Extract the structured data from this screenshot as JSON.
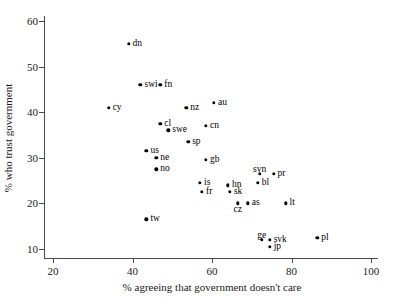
{
  "chart_data": {
    "type": "scatter",
    "title": "",
    "xlabel": "% agreeing that government doesn't care",
    "ylabel": "% who trust government",
    "xlim": [
      20,
      100
    ],
    "ylim": [
      10,
      60
    ],
    "xticks": [
      20,
      40,
      60,
      80,
      100
    ],
    "yticks": [
      10,
      20,
      30,
      40,
      50,
      60
    ],
    "grid": false,
    "legend": "none",
    "point_color": "#000000",
    "points": [
      {
        "label": "dn",
        "x": 39.0,
        "y": 55.0,
        "pos": "right"
      },
      {
        "label": "swi",
        "x": 42.0,
        "y": 46.0,
        "pos": "right"
      },
      {
        "label": "fn",
        "x": 47.0,
        "y": 46.0,
        "pos": "right"
      },
      {
        "label": "cy",
        "x": 34.0,
        "y": 41.0,
        "pos": "right"
      },
      {
        "label": "cl",
        "x": 47.0,
        "y": 37.5,
        "pos": "right"
      },
      {
        "label": "swe",
        "x": 49.0,
        "y": 36.0,
        "pos": "right"
      },
      {
        "label": "us",
        "x": 43.5,
        "y": 31.5,
        "pos": "right"
      },
      {
        "label": "ne",
        "x": 46.0,
        "y": 30.0,
        "pos": "right"
      },
      {
        "label": "no",
        "x": 46.0,
        "y": 27.5,
        "pos": "right"
      },
      {
        "label": "tw",
        "x": 43.5,
        "y": 16.5,
        "pos": "right"
      },
      {
        "label": "nz",
        "x": 53.5,
        "y": 41.0,
        "pos": "right"
      },
      {
        "label": "au",
        "x": 60.5,
        "y": 42.0,
        "pos": "right"
      },
      {
        "label": "cn",
        "x": 58.5,
        "y": 37.0,
        "pos": "right"
      },
      {
        "label": "sp",
        "x": 54.0,
        "y": 33.5,
        "pos": "right"
      },
      {
        "label": "gb",
        "x": 58.5,
        "y": 29.5,
        "pos": "right"
      },
      {
        "label": "is",
        "x": 57.0,
        "y": 24.5,
        "pos": "right"
      },
      {
        "label": "fr",
        "x": 57.5,
        "y": 22.5,
        "pos": "right"
      },
      {
        "label": "hn",
        "x": 64.0,
        "y": 24.0,
        "pos": "right"
      },
      {
        "label": "sk",
        "x": 64.5,
        "y": 22.5,
        "pos": "right"
      },
      {
        "label": "cz",
        "x": 66.5,
        "y": 20.0,
        "pos": "below"
      },
      {
        "label": "as",
        "x": 69.0,
        "y": 20.0,
        "pos": "right"
      },
      {
        "label": "svn",
        "x": 72.0,
        "y": 26.5,
        "pos": "above"
      },
      {
        "label": "bl",
        "x": 71.5,
        "y": 24.5,
        "pos": "right"
      },
      {
        "label": "pr",
        "x": 75.5,
        "y": 26.5,
        "pos": "right"
      },
      {
        "label": "lt",
        "x": 78.5,
        "y": 20.0,
        "pos": "right"
      },
      {
        "label": "ge",
        "x": 72.5,
        "y": 12.0,
        "pos": "above"
      },
      {
        "label": "svk",
        "x": 74.5,
        "y": 12.0,
        "pos": "right"
      },
      {
        "label": "jp",
        "x": 74.5,
        "y": 10.5,
        "pos": "right"
      },
      {
        "label": "pl",
        "x": 86.5,
        "y": 12.5,
        "pos": "right"
      }
    ]
  }
}
